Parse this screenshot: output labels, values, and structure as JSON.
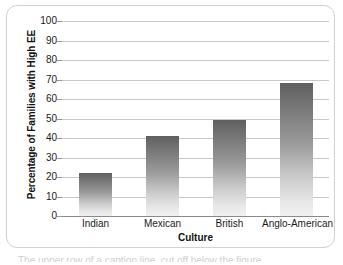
{
  "figure": {
    "frame_border_color": "#d2d2d2",
    "background": "#ffffff"
  },
  "chart_data": {
    "type": "bar",
    "title": "",
    "subtitle": "",
    "xlabel": "Culture",
    "ylabel": "Percentage of Families with High EE",
    "categories": [
      "Indian",
      "Mexican",
      "British",
      "Anglo-American"
    ],
    "values": [
      22,
      41,
      49,
      68
    ],
    "ylim": [
      0,
      100
    ],
    "yticks": [
      0,
      10,
      20,
      30,
      40,
      50,
      60,
      70,
      80,
      90,
      100
    ],
    "ytick_labels": [
      "0",
      "10",
      "20",
      "30",
      "40",
      "50",
      "60",
      "70",
      "80",
      "90",
      "100"
    ],
    "grid": true,
    "grid_axis": "y",
    "grid_color": "#c9c9c9",
    "legend": null,
    "legend_position": "none",
    "bar_fill_top_color": "#5f5f5f",
    "bar_fill_bottom_color": "#f1f1f1",
    "axis_line_color": "#8a8a8a"
  },
  "caption": {
    "partial_text": "The upper row of a caption line, cut off below the figure"
  }
}
